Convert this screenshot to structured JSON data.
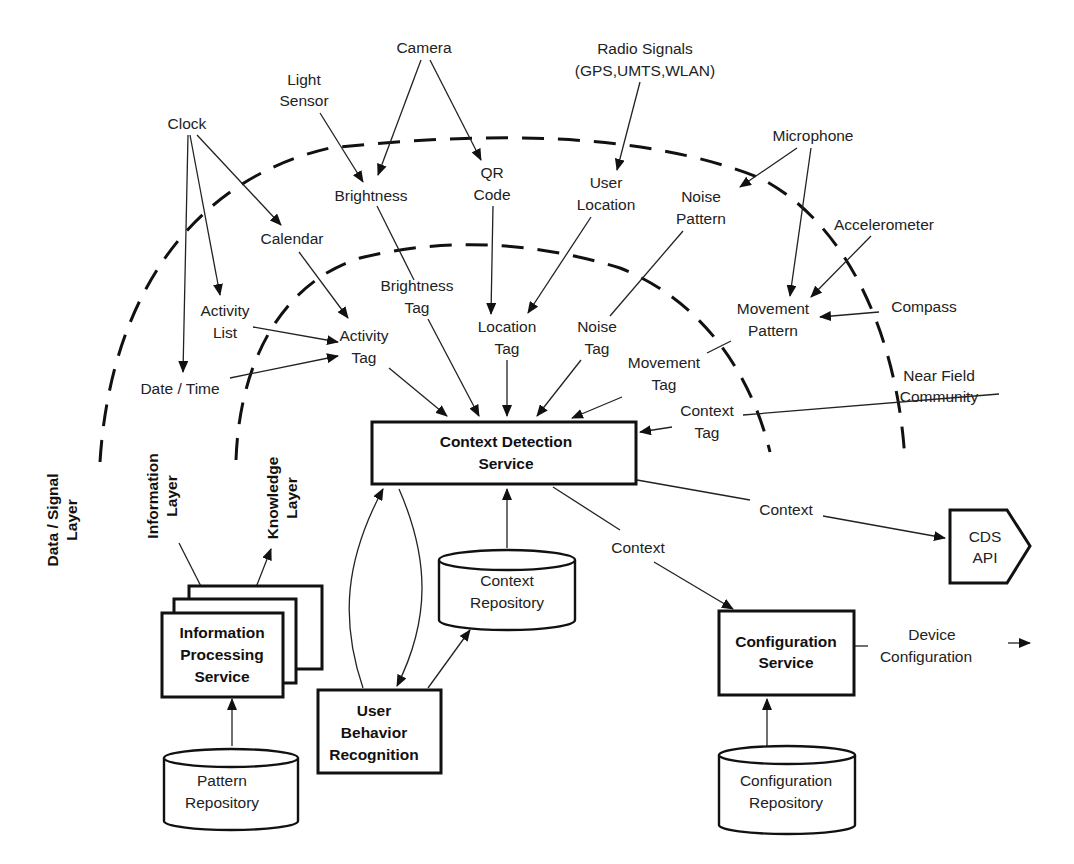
{
  "layers": {
    "data_signal": [
      "Data / Signal",
      "Layer"
    ],
    "information": [
      "Information",
      "Layer"
    ],
    "knowledge": [
      "Knowledge",
      "Layer"
    ]
  },
  "sources": {
    "camera": [
      "Camera"
    ],
    "light_sensor": [
      "Light",
      "Sensor"
    ],
    "radio": [
      "Radio Signals",
      "(GPS,UMTS,WLAN)"
    ],
    "clock": [
      "Clock"
    ],
    "microphone": [
      "Microphone"
    ],
    "accelerometer": [
      "Accelerometer"
    ],
    "compass": [
      "Compass"
    ],
    "near_field": [
      "Near Field",
      "Community"
    ]
  },
  "information": {
    "brightness": [
      "Brightness"
    ],
    "qr_code": [
      "QR",
      "Code"
    ],
    "user_location": [
      "User",
      "Location"
    ],
    "noise_pattern": [
      "Noise",
      "Pattern"
    ],
    "calendar": [
      "Calendar"
    ],
    "activity_list": [
      "Activity",
      "List"
    ],
    "date_time": [
      "Date / Time"
    ],
    "movement_pattern": [
      "Movement",
      "Pattern"
    ]
  },
  "tags": {
    "brightness_tag": [
      "Brightness",
      "Tag"
    ],
    "activity_tag": [
      "Activity",
      "Tag"
    ],
    "location_tag": [
      "Location",
      "Tag"
    ],
    "noise_tag": [
      "Noise",
      "Tag"
    ],
    "movement_tag": [
      "Movement",
      "Tag"
    ],
    "context_tag": [
      "Context",
      "Tag"
    ]
  },
  "services": {
    "cds": [
      "Context Detection",
      "Service"
    ],
    "ips": [
      "Information",
      "Processing",
      "Service"
    ],
    "ubr": [
      "User",
      "Behavior",
      "Recognition"
    ],
    "config": [
      "Configuration",
      "Service"
    ]
  },
  "repositories": {
    "context": [
      "Context",
      "Repository"
    ],
    "pattern": [
      "Pattern",
      "Repository"
    ],
    "configuration": [
      "Configuration",
      "Repository"
    ]
  },
  "outputs": {
    "context_1": "Context",
    "context_2": "Context",
    "cds_api": [
      "CDS",
      "API"
    ],
    "device_config": [
      "Device",
      "Configuration"
    ]
  }
}
